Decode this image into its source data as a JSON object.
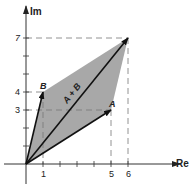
{
  "diagram": {
    "type": "vector-addition-complex-plane",
    "axes": {
      "x_label": "Re",
      "y_label": "Im",
      "x_ticks": [
        1,
        2,
        3,
        4,
        5,
        6
      ],
      "y_ticks": [
        1,
        2,
        3,
        4,
        5,
        6,
        7
      ],
      "x_tick_labels": [
        "1",
        "5",
        "6"
      ],
      "y_tick_labels": [
        "3",
        "4",
        "7"
      ]
    },
    "vectors": [
      {
        "name": "A",
        "label": "A",
        "x": 5,
        "y": 3
      },
      {
        "name": "B",
        "label": "B",
        "x": 1,
        "y": 4
      },
      {
        "name": "A+B",
        "label": "A + B",
        "x": 6,
        "y": 7
      }
    ],
    "colors": {
      "parallelogram_fill": "#a8a8a8",
      "vector_stroke": "#111111",
      "axis_stroke": "#333333",
      "dashed_guide": "#777777",
      "background": "#ffffff"
    }
  },
  "labels": {
    "re": "Re",
    "im": "Im",
    "a": "A",
    "b": "B",
    "sum": "A + B",
    "tick_1": "1",
    "tick_5": "5",
    "tick_6": "6",
    "tick_3": "3",
    "tick_4": "4",
    "tick_7": "7"
  }
}
